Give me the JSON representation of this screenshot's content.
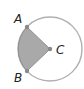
{
  "diagram": {
    "title": "",
    "circle": {
      "center_label": "C",
      "cx": 50,
      "cy": 49,
      "r": 32,
      "stroke": "#a8a8a8"
    },
    "sector": {
      "from": "A",
      "to": "B",
      "center": "C",
      "fill": "#a9a9a9",
      "stroke": "#8a8a8a"
    },
    "points": [
      {
        "label": "A",
        "x": 27,
        "y": 27,
        "label_x": 14,
        "label_y": 23
      },
      {
        "label": "B",
        "x": 27,
        "y": 71,
        "label_x": 14,
        "label_y": 82
      },
      {
        "label": "C",
        "x": 50,
        "y": 49,
        "label_x": 56,
        "label_y": 55
      }
    ],
    "point_color": "#8a8a8a"
  }
}
